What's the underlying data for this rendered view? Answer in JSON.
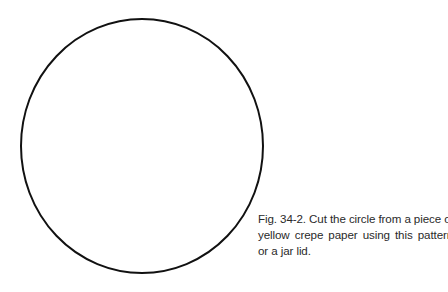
{
  "figure": {
    "shape": "circle",
    "stroke_color": "#111111",
    "stroke_width": 2,
    "center": [
      142,
      146
    ],
    "radius_x": 121,
    "radius_y": 127
  },
  "caption": {
    "lines": [
      "Fig. 34-2. Cut the circle from a piece of",
      "yellow  crepe  paper  using  this  pattern",
      "or a jar  lid."
    ],
    "full_text": "Fig. 34-2. Cut the circle from a piece of yellow crepe paper using this pattern or a jar lid."
  }
}
